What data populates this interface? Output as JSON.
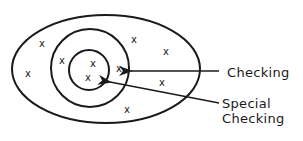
{
  "diagram": {
    "type": "nested-sets",
    "sets": [
      {
        "name": "outer",
        "shape": "ellipse",
        "cx": 106,
        "cy": 69,
        "rx": 94,
        "ry": 54
      },
      {
        "name": "checking",
        "shape": "circle",
        "cx": 90,
        "cy": 68,
        "r": 39
      },
      {
        "name": "special-checking",
        "shape": "circle",
        "cx": 89,
        "cy": 70,
        "r": 20
      }
    ],
    "marker_glyph": "x",
    "markers": [
      {
        "x": 42,
        "y": 44
      },
      {
        "x": 28,
        "y": 74
      },
      {
        "x": 62,
        "y": 61
      },
      {
        "x": 93,
        "y": 64
      },
      {
        "x": 88,
        "y": 78
      },
      {
        "x": 119,
        "y": 69
      },
      {
        "x": 134,
        "y": 40
      },
      {
        "x": 166,
        "y": 52
      },
      {
        "x": 162,
        "y": 83
      },
      {
        "x": 127,
        "y": 110
      }
    ],
    "labels": {
      "checking": "Checking",
      "special_line1": "Special",
      "special_line2": "Checking"
    },
    "arrows": [
      {
        "from": "Checking",
        "to": "checking-circle"
      },
      {
        "from": "Special Checking",
        "to": "special-checking-circle"
      }
    ],
    "stroke_color": "#1a1a1a"
  }
}
